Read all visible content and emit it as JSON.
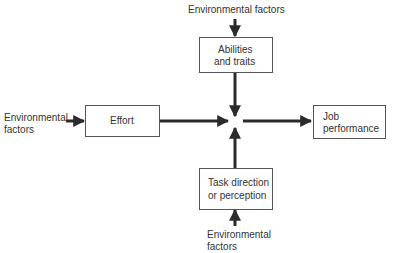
{
  "diagram": {
    "nodes": {
      "env_top": {
        "label": "Environmental factors"
      },
      "abilities": {
        "label_line1": "Abilities",
        "label_line2": "and traits"
      },
      "env_left": {
        "label_line1": "Environmental",
        "label_line2": "factors"
      },
      "effort": {
        "label": "Effort"
      },
      "job": {
        "label_line1": "Job",
        "label_line2": "performance"
      },
      "task": {
        "label_line1": "Task direction",
        "label_line2": "or perception"
      },
      "env_bottom": {
        "label_line1": "Environmental",
        "label_line2": "factors"
      }
    },
    "edges": [
      {
        "from": "env_top",
        "to": "abilities"
      },
      {
        "from": "abilities",
        "to": "junction"
      },
      {
        "from": "env_left",
        "to": "effort"
      },
      {
        "from": "effort",
        "to": "junction"
      },
      {
        "from": "task",
        "to": "junction"
      },
      {
        "from": "env_bottom",
        "to": "task"
      },
      {
        "from": "junction",
        "to": "job"
      }
    ],
    "colors": {
      "arrow": "#2b2b2b",
      "box_border": "#555555",
      "text": "#333333"
    }
  }
}
